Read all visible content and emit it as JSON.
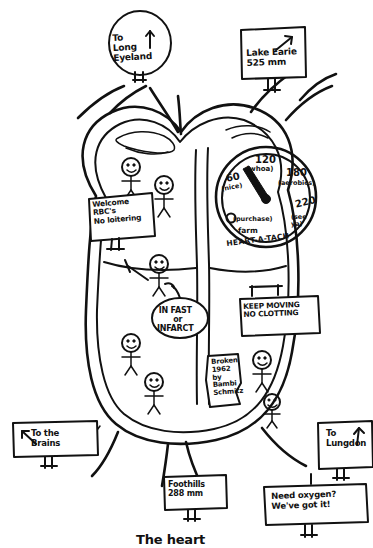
{
  "title": "The heart",
  "caption": "The heart",
  "signs": {
    "long_island": {
      "line1": "To",
      "line2": "Long",
      "line3": "Eyeland",
      "arrow": "up-arrow-icon"
    },
    "lake_erie": {
      "line1": "Lake Earie",
      "line2": "525 mm",
      "arrow": "up-right-arrow-icon"
    },
    "welcome_rbc": {
      "line1": "Welcome",
      "line2": "RBC's",
      "line3": "No loitering"
    },
    "in_fast": {
      "line1": "IN FAST",
      "line2": "or",
      "line3": "INFARCT"
    },
    "keep_moving": {
      "line1": "KEEP MOVING",
      "line2": "NO CLOTTING"
    },
    "broken": {
      "line1": "Broken",
      "line2": "1962",
      "line3": "by",
      "line4": "Bambi",
      "line5": "Schmitz"
    },
    "to_brains": {
      "line1": "To the",
      "line2": "Brains",
      "arrow": "up-left-arrow-icon"
    },
    "to_lungdon": {
      "line1": "To",
      "line2": "Lungdon",
      "arrow": "up-arrow-icon"
    },
    "foothills": {
      "line1": "Foothills",
      "line2": "288 mm"
    },
    "need_oxygen": {
      "line1": "Need oxygen?",
      "line2": "We've got it!"
    }
  },
  "gauge": {
    "name": "HEART-A-TACH",
    "readings": [
      {
        "value": "0",
        "note": "(purchase)"
      },
      {
        "value": "60",
        "note": "(nice)"
      },
      {
        "value": "120",
        "note": "(whoa)"
      },
      {
        "value": "180",
        "note": "(aerobics)"
      },
      {
        "value": "220",
        "note": "(see ya)"
      }
    ],
    "zero_sub": "farm",
    "seeya_line1": "(see",
    "seeya_line2": "ya)"
  },
  "colors": {
    "ink": "#111111",
    "paper": "#ffffff"
  }
}
